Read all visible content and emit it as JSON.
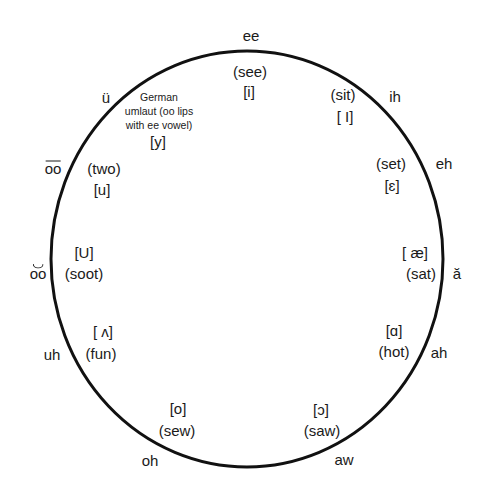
{
  "diagram": {
    "type": "vowel-circle",
    "stroke_color": "#111111",
    "text_color": "#1a1a1a",
    "circle": {
      "cx": 247,
      "cy": 259,
      "rx": 196,
      "ry": 208
    },
    "vowels": [
      {
        "id": "ee",
        "outer": "ee",
        "word": "(see)",
        "ipa": "[i]"
      },
      {
        "id": "ih",
        "outer": "ih",
        "word": "(sit)",
        "ipa": "[ I]"
      },
      {
        "id": "eh",
        "outer": "eh",
        "word": "(set)",
        "ipa": "[ɛ]"
      },
      {
        "id": "a-short",
        "outer": "ă",
        "word": "(sat)",
        "ipa": "[ æ]"
      },
      {
        "id": "ah",
        "outer": "ah",
        "word": "(hot)",
        "ipa": "[ɑ]"
      },
      {
        "id": "aw",
        "outer": "aw",
        "word": "(saw)",
        "ipa": "[ɔ]"
      },
      {
        "id": "oh",
        "outer": "oh",
        "word": "(sew)",
        "ipa": "[o]"
      },
      {
        "id": "uh",
        "outer": "uh",
        "word": "(fun)",
        "ipa": "[ ʌ]"
      },
      {
        "id": "oo-short",
        "outer": "oo",
        "word": "(soot)",
        "ipa": "[U]"
      },
      {
        "id": "oo-long",
        "outer": "oo",
        "word": "(two)",
        "ipa": "[u]"
      },
      {
        "id": "u-umlaut",
        "outer": "ü",
        "note_lines": [
          "German",
          "umlaut (oo lips",
          "with ee vowel)"
        ],
        "ipa": "[y]"
      }
    ]
  }
}
